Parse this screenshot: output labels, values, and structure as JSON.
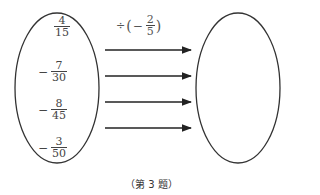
{
  "left_set": {
    "items": [
      {
        "sign": "",
        "numerator": "4",
        "denominator": "15"
      },
      {
        "sign": "−",
        "numerator": "7",
        "denominator": "30"
      },
      {
        "sign": "−",
        "numerator": "8",
        "denominator": "45"
      },
      {
        "sign": "−",
        "numerator": "3",
        "denominator": "50"
      }
    ]
  },
  "operation": {
    "operator": "÷",
    "open_paren": "(",
    "sign": "−",
    "numerator": "2",
    "denominator": "5",
    "close_paren": ")"
  },
  "right_set": {
    "items": []
  },
  "caption": "（第 3 题）"
}
